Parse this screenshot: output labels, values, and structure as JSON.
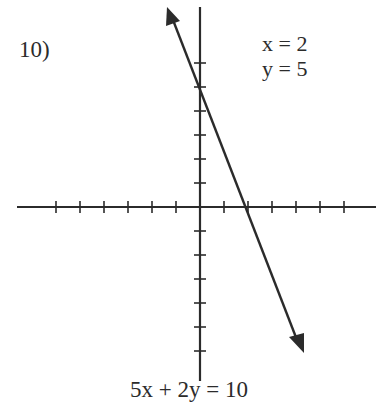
{
  "problem": {
    "number": "10)",
    "equation": "5x + 2y = 10",
    "answer": {
      "x_label": "x = 2",
      "y_label": "y = 5"
    }
  },
  "graph": {
    "axis_color": "#2b2b2b",
    "line_color": "#2b2b2b",
    "x_ticks_left": 6,
    "x_ticks_right": 6,
    "y_ticks_up": 6,
    "y_ticks_down": 6,
    "unit_px": 24
  },
  "chart_data": {
    "type": "line",
    "title": "5x + 2y = 10",
    "xlabel": "",
    "ylabel": "",
    "xlim": [
      -7.5,
      7.3
    ],
    "ylim": [
      -7.2,
      8.3
    ],
    "grid": false,
    "series": [
      {
        "name": "5x + 2y = 10",
        "x": [
          -1.4,
          4.3
        ],
        "y": [
          8.3,
          -6.1
        ]
      }
    ],
    "intercepts": {
      "x_intercept": [
        2,
        0
      ],
      "y_intercept": [
        0,
        5
      ]
    },
    "annotations": [
      "10)",
      "x = 2",
      "y = 5"
    ]
  }
}
